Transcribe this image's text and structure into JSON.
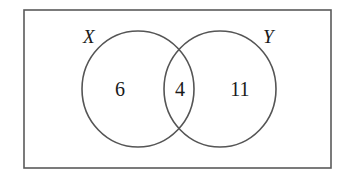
{
  "diagram": {
    "type": "venn",
    "universal_set_label": "",
    "sets": [
      {
        "name": "X",
        "label": "X"
      },
      {
        "name": "Y",
        "label": "Y"
      }
    ],
    "regions": {
      "x_only": "6",
      "x_and_y": "4",
      "y_only": "11"
    },
    "colors": {
      "stroke": "#555555",
      "text": "#1a1a1a",
      "background": "#ffffff"
    }
  }
}
